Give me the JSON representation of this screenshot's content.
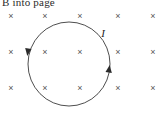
{
  "figure": {
    "caption": "B into page",
    "background_color": "#ffffff",
    "stroke_color": "#3a3a3a",
    "cross_color": "#555555",
    "width": 158,
    "height": 116
  },
  "field_marks": {
    "symbol": "×",
    "meaning": "magnetic-field-into-page",
    "rows": 3,
    "columns": 5,
    "positions": [
      {
        "x": 11,
        "y": 16
      },
      {
        "x": 45,
        "y": 16
      },
      {
        "x": 80,
        "y": 16
      },
      {
        "x": 118,
        "y": 16
      },
      {
        "x": 153,
        "y": 16
      },
      {
        "x": 11,
        "y": 52
      },
      {
        "x": 45,
        "y": 52
      },
      {
        "x": 80,
        "y": 52
      },
      {
        "x": 118,
        "y": 52
      },
      {
        "x": 153,
        "y": 52
      },
      {
        "x": 11,
        "y": 88
      },
      {
        "x": 45,
        "y": 88
      },
      {
        "x": 80,
        "y": 88
      },
      {
        "x": 118,
        "y": 88
      },
      {
        "x": 153,
        "y": 88
      }
    ]
  },
  "current_loop": {
    "label": "I",
    "center_x": 69,
    "center_y": 64,
    "radius_x": 41,
    "radius_y": 42,
    "label_x": 103,
    "label_y": 33,
    "direction": "counterclockwise",
    "arrow_left": {
      "x": 28,
      "y": 51
    },
    "arrow_right": {
      "x": 109,
      "y": 70
    }
  }
}
